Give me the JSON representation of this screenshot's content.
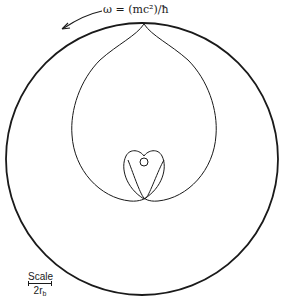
{
  "diagram": {
    "annotation": {
      "omega_label": "ω = (mc²)/ħ",
      "rotation_direction": "counterclockwise"
    },
    "scale": {
      "title": "Scale",
      "unit_main": "2r",
      "unit_sub": "b"
    },
    "shapes": {
      "outer_circle": {
        "cx": 142,
        "cy": 159,
        "r": 136
      },
      "large_loop": "cardioid-like loop with top cusp on outer circle",
      "small_loop": "small heart-shaped loop inside lower part of large loop",
      "inner_circle": {
        "cx": 144,
        "cy": 162,
        "r": 4
      }
    },
    "colors": {
      "stroke": "#1a1a1a",
      "background": "#ffffff"
    }
  }
}
